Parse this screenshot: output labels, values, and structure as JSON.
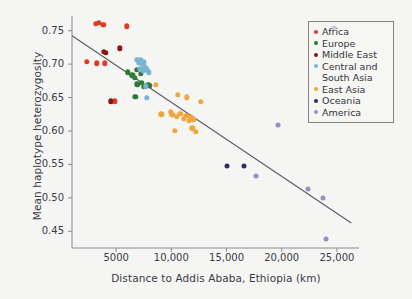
{
  "chart_data": {
    "type": "scatter",
    "title": "",
    "xlabel": "Distance to Addis Ababa, Ethiopia (km)",
    "ylabel": "Mean haplotype heterozygosity",
    "xlim": [
      1000,
      27000
    ],
    "ylim": [
      0.425,
      0.772
    ],
    "xticks": [
      5000,
      10000,
      15000,
      20000,
      25000
    ],
    "xtick_labels": [
      "5000",
      "10,000",
      "15,000",
      "20,000",
      "25,000"
    ],
    "yticks": [
      0.45,
      0.5,
      0.55,
      0.6,
      0.65,
      0.7,
      0.75
    ],
    "ytick_labels": [
      "0.45",
      "0.50",
      "0.55",
      "0.60",
      "0.65",
      "0.70",
      "0.75"
    ],
    "grid": false,
    "legend_position": "top-right",
    "trendline": {
      "name": "linear fit",
      "x": [
        1000,
        26300
      ],
      "y": [
        0.7425,
        0.4625
      ],
      "color": "#5a5a62"
    },
    "series": [
      {
        "name": "Africa",
        "color": "#e03b22",
        "values": [
          {
            "x": 3150,
            "y": 0.76
          },
          {
            "x": 3450,
            "y": 0.7615
          },
          {
            "x": 3850,
            "y": 0.759
          },
          {
            "x": 5950,
            "y": 0.7565
          },
          {
            "x": 2350,
            "y": 0.7035
          },
          {
            "x": 3250,
            "y": 0.7015
          },
          {
            "x": 3950,
            "y": 0.701
          },
          {
            "x": 4900,
            "y": 0.6445
          }
        ]
      },
      {
        "name": "Europe",
        "color": "#2f7a34",
        "values": [
          {
            "x": 6050,
            "y": 0.688
          },
          {
            "x": 6450,
            "y": 0.6835
          },
          {
            "x": 6700,
            "y": 0.68
          },
          {
            "x": 6850,
            "y": 0.6915
          },
          {
            "x": 6900,
            "y": 0.67
          },
          {
            "x": 7250,
            "y": 0.6855
          },
          {
            "x": 7350,
            "y": 0.6725
          },
          {
            "x": 7500,
            "y": 0.6665
          },
          {
            "x": 6750,
            "y": 0.6515
          },
          {
            "x": 7900,
            "y": 0.6695
          },
          {
            "x": 8050,
            "y": 0.6675
          }
        ]
      },
      {
        "name": "Middle East",
        "color": "#8c1510",
        "values": [
          {
            "x": 3900,
            "y": 0.718
          },
          {
            "x": 4050,
            "y": 0.7165
          },
          {
            "x": 5350,
            "y": 0.7235
          },
          {
            "x": 4500,
            "y": 0.6445
          }
        ]
      },
      {
        "name": "Central and South Asia",
        "color": "#79b3d6",
        "values": [
          {
            "x": 6900,
            "y": 0.7065
          },
          {
            "x": 7100,
            "y": 0.702
          },
          {
            "x": 7250,
            "y": 0.7065
          },
          {
            "x": 7350,
            "y": 0.7005
          },
          {
            "x": 7500,
            "y": 0.703
          },
          {
            "x": 7200,
            "y": 0.693
          },
          {
            "x": 7450,
            "y": 0.6905
          },
          {
            "x": 7600,
            "y": 0.695
          },
          {
            "x": 7800,
            "y": 0.692
          },
          {
            "x": 7950,
            "y": 0.688
          },
          {
            "x": 7700,
            "y": 0.667
          },
          {
            "x": 7800,
            "y": 0.6495
          }
        ]
      },
      {
        "name": "East Asia",
        "color": "#f0a63c",
        "values": [
          {
            "x": 8600,
            "y": 0.669
          },
          {
            "x": 10600,
            "y": 0.6545
          },
          {
            "x": 11400,
            "y": 0.6505
          },
          {
            "x": 12650,
            "y": 0.644
          },
          {
            "x": 9100,
            "y": 0.625
          },
          {
            "x": 9950,
            "y": 0.628
          },
          {
            "x": 10100,
            "y": 0.6245
          },
          {
            "x": 10500,
            "y": 0.621
          },
          {
            "x": 10800,
            "y": 0.626
          },
          {
            "x": 11150,
            "y": 0.6185
          },
          {
            "x": 11350,
            "y": 0.623
          },
          {
            "x": 11600,
            "y": 0.615
          },
          {
            "x": 11750,
            "y": 0.6205
          },
          {
            "x": 12000,
            "y": 0.6165
          },
          {
            "x": 10300,
            "y": 0.6
          },
          {
            "x": 11900,
            "y": 0.604
          },
          {
            "x": 12200,
            "y": 0.599
          }
        ]
      },
      {
        "name": "Oceania",
        "color": "#2d2d66",
        "values": [
          {
            "x": 15000,
            "y": 0.547
          },
          {
            "x": 16600,
            "y": 0.547
          }
        ]
      },
      {
        "name": "America",
        "color": "#9b8ec4",
        "values": [
          {
            "x": 19700,
            "y": 0.609
          },
          {
            "x": 17700,
            "y": 0.5325
          },
          {
            "x": 22400,
            "y": 0.5135
          },
          {
            "x": 23700,
            "y": 0.5
          },
          {
            "x": 24000,
            "y": 0.439
          },
          {
            "x": 24700,
            "y": 0.7545
          }
        ]
      }
    ]
  },
  "legend": {
    "items": [
      {
        "label": "Africa",
        "color": "#e03b22"
      },
      {
        "label": "Europe",
        "color": "#2f7a34"
      },
      {
        "label": "Middle East",
        "color": "#8c1510"
      },
      {
        "label": "Central and South Asia",
        "color": "#79b3d6"
      },
      {
        "label": "East Asia",
        "color": "#f0a63c"
      },
      {
        "label": "Oceania",
        "color": "#2d2d66"
      },
      {
        "label": "America",
        "color": "#9b8ec4"
      }
    ]
  }
}
